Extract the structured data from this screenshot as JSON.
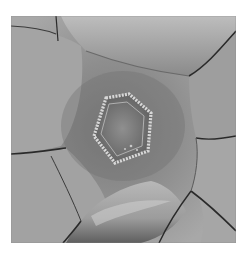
{
  "image": {
    "description": "Grayscale clinical photograph showing a wound with sutured edges surrounded by skin folds",
    "colors": {
      "background": "#ffffff",
      "skin_light": "#c8c8c8",
      "skin_mid": "#9a9a9a",
      "skin_dark": "#5a5a5a",
      "crease": "#2a2a2a",
      "wound_edge": "#d8d8d8"
    }
  }
}
